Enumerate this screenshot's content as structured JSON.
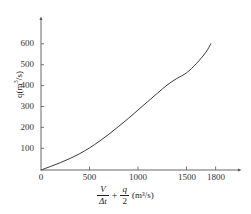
{
  "chart_data": {
    "type": "line",
    "title": "",
    "subtitle": "",
    "xlabel_parts": {
      "numerator_1": "V",
      "denominator_1": "Δt",
      "operator": "+",
      "numerator_2": "q",
      "denominator_2": "2",
      "unit": "(m³/s)"
    },
    "xlabel": "V/Δt + q/2 (m³/s)",
    "ylabel": "q(m³/s)",
    "ylabel_parts": {
      "symbol": "q",
      "unit_open": "(m",
      "unit_exp": "3",
      "unit_close": "/s)"
    },
    "x_ticks": [
      0,
      500,
      1000,
      1500,
      1800
    ],
    "x_tick_labels": [
      "0",
      "500",
      "1000",
      "1500",
      "1800"
    ],
    "y_ticks": [
      100,
      200,
      300,
      400,
      500,
      600
    ],
    "y_tick_labels": [
      "100",
      "200",
      "300",
      "400",
      "500",
      "600"
    ],
    "xlim": [
      0,
      1950
    ],
    "ylim": [
      0,
      660
    ],
    "grid": false,
    "legend": false,
    "axis_style": "arrow-ended",
    "series": [
      {
        "name": "storage-discharge-curve",
        "color": "#3a3a3a",
        "line_width": 1,
        "x": [
          0,
          100,
          200,
          300,
          400,
          500,
          600,
          700,
          800,
          900,
          1000,
          1100,
          1200,
          1300,
          1400,
          1500,
          1600,
          1700,
          1750
        ],
        "y": [
          0,
          17,
          35,
          55,
          78,
          105,
          136,
          170,
          207,
          245,
          285,
          325,
          365,
          404,
          435,
          462,
          505,
          560,
          600
        ]
      }
    ],
    "curve_endpoint": {
      "x": 1750,
      "y": 600
    },
    "colors": {
      "axis": "#555555",
      "curve": "#3a3a3a",
      "tick_text": "#333333",
      "label_text": "#222222",
      "background": "#ffffff"
    }
  }
}
